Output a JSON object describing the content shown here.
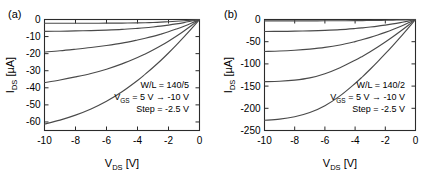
{
  "figure": {
    "background_color": "#ffffff",
    "curve_color": "#4a4a4a",
    "axis_color": "#2b2b2b"
  },
  "panels": [
    {
      "tag": "(a)",
      "annotation": {
        "line1": "W/L = 140/5",
        "line2_pre": "V",
        "line2_sub": "GS",
        "line2_post": " = 5 V → -10 V",
        "line3": "Step = -2.5 V"
      },
      "chart_data": {
        "type": "line",
        "title": "(a)",
        "xlabel": "V_DS [V]",
        "ylabel": "I_DS [µA]",
        "xlabel_main": "V",
        "xlabel_sub": "DS",
        "xlabel_unit": " [V]",
        "ylabel_main": "I",
        "ylabel_sub": "DS",
        "ylabel_unit": " [µA]",
        "xlim": [
          -10,
          0
        ],
        "ylim": [
          -65,
          0
        ],
        "xticks": [
          -10,
          -8,
          -6,
          -4,
          -2,
          0
        ],
        "xticklabels": [
          "-10",
          "-8",
          "-6",
          "-4",
          "-2",
          "0"
        ],
        "yticks": [
          0,
          -10,
          -20,
          -30,
          -40,
          -50,
          -60
        ],
        "yticklabels": [
          "0",
          "-10",
          "-20",
          "-30",
          "-40",
          "-50",
          "-60"
        ],
        "grid": false,
        "legend": null,
        "annotations": [
          "W/L = 140/5",
          "V_GS = 5 V → -10 V",
          "Step = -2.5 V"
        ],
        "x": [
          0,
          -0.5,
          -1,
          -1.5,
          -2,
          -2.5,
          -3,
          -3.5,
          -4,
          -5,
          -6,
          -7,
          -8,
          -9,
          -10
        ],
        "series": [
          {
            "name": "VGS = -2.5 V",
            "values": [
              0,
              -0.35,
              -0.7,
              -1.0,
              -1.3,
              -1.55,
              -1.75,
              -1.9,
              -2.0,
              -2.1,
              -2.15,
              -2.2,
              -2.2,
              -2.2,
              -2.2
            ]
          },
          {
            "name": "VGS = -5 V",
            "values": [
              0,
              -0.9,
              -1.8,
              -2.6,
              -3.3,
              -3.9,
              -4.4,
              -4.85,
              -5.2,
              -5.8,
              -6.2,
              -6.5,
              -6.7,
              -6.85,
              -6.95
            ]
          },
          {
            "name": "VGS = -7.5 V",
            "values": [
              0,
              -2.0,
              -3.9,
              -5.6,
              -7.2,
              -8.6,
              -9.9,
              -11.0,
              -12.0,
              -13.8,
              -15.2,
              -16.4,
              -17.4,
              -18.3,
              -19.0
            ]
          },
          {
            "name": "VGS = -10 V",
            "values": [
              0,
              -3.4,
              -6.7,
              -9.8,
              -12.7,
              -15.4,
              -17.9,
              -20.2,
              -22.3,
              -26.0,
              -29.1,
              -31.6,
              -33.6,
              -35.4,
              -37.0
            ]
          },
          {
            "name": "VGS = -12.5 V",
            "values": [
              0,
              -5.2,
              -10.2,
              -15.0,
              -19.6,
              -24.0,
              -28.1,
              -32.0,
              -35.7,
              -42.3,
              -47.9,
              -52.4,
              -56.0,
              -58.9,
              -61.2
            ]
          }
        ]
      }
    },
    {
      "tag": "(b)",
      "annotation": {
        "line1": "W/L = 140/2",
        "line2_pre": "V",
        "line2_sub": "GS",
        "line2_post": " = 5 V → -10 V",
        "line3": "Step = -2.5 V"
      },
      "chart_data": {
        "type": "line",
        "title": "(b)",
        "xlabel": "V_DS [V]",
        "ylabel": "I_DS [µA]",
        "xlabel_main": "V",
        "xlabel_sub": "DS",
        "xlabel_unit": " [V]",
        "ylabel_main": "I",
        "ylabel_sub": "DS",
        "ylabel_unit": " [µA]",
        "xlim": [
          -10,
          0
        ],
        "ylim": [
          -250,
          0
        ],
        "xticks": [
          -10,
          -8,
          -6,
          -4,
          -2,
          0
        ],
        "xticklabels": [
          "-10",
          "-8",
          "-6",
          "-4",
          "-2",
          "0"
        ],
        "yticks": [
          0,
          -50,
          -100,
          -150,
          -200,
          -250
        ],
        "yticklabels": [
          "0",
          "-50",
          "-100",
          "-150",
          "-200",
          "-250"
        ],
        "grid": false,
        "legend": null,
        "annotations": [
          "W/L = 140/2",
          "V_GS = 5 V → -10 V",
          "Step = -2.5 V"
        ],
        "x": [
          0,
          -0.5,
          -1,
          -1.5,
          -2,
          -2.5,
          -3,
          -3.5,
          -4,
          -5,
          -6,
          -7,
          -8,
          -9,
          -10
        ],
        "series": [
          {
            "name": "VGS = -2.5 V",
            "values": [
              0,
              -0.5,
              -0.95,
              -1.35,
              -1.7,
              -2.0,
              -2.25,
              -2.45,
              -2.6,
              -2.8,
              -2.9,
              -3.0,
              -3.05,
              -3.1,
              -3.1
            ]
          },
          {
            "name": "VGS = -5 V",
            "values": [
              0,
              -3.6,
              -7.0,
              -10.0,
              -12.6,
              -15.0,
              -17.0,
              -18.8,
              -20.3,
              -22.8,
              -24.4,
              -25.6,
              -26.3,
              -26.8,
              -27.0
            ]
          },
          {
            "name": "VGS = -7.5 V",
            "values": [
              0,
              -8.0,
              -15.6,
              -22.6,
              -29.0,
              -34.9,
              -40.3,
              -45.2,
              -49.7,
              -57.4,
              -62.9,
              -66.6,
              -69.2,
              -71.0,
              -72.0
            ]
          },
          {
            "name": "VGS = -10 V",
            "values": [
              0,
              -13.5,
              -26.6,
              -39.0,
              -50.8,
              -62.0,
              -72.6,
              -82.5,
              -91.8,
              -108.5,
              -122.0,
              -131.5,
              -136.5,
              -139.0,
              -140.0
            ]
          },
          {
            "name": "VGS = -12.5 V",
            "values": [
              0,
              -20.0,
              -39.6,
              -58.6,
              -77.0,
              -94.8,
              -112.0,
              -128.5,
              -144.0,
              -172.0,
              -194.0,
              -209.5,
              -219.0,
              -224.5,
              -227.0
            ]
          }
        ]
      }
    }
  ]
}
